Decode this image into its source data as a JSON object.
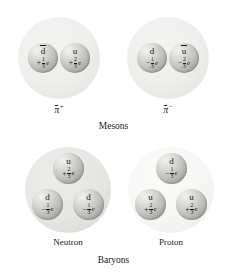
{
  "figure": {
    "sections": [
      {
        "caption": "Mesons",
        "particles": [
          {
            "name": "pi-plus",
            "symbol": "π",
            "superscript": "+",
            "label": "",
            "quarks": [
              {
                "flavor": "d",
                "antiquark": true,
                "charge_sign": "+",
                "numerator": "1",
                "denominator": "3",
                "unit": "e"
              },
              {
                "flavor": "u",
                "antiquark": false,
                "charge_sign": "+",
                "numerator": "2",
                "denominator": "3",
                "unit": "e"
              }
            ]
          },
          {
            "name": "pi-minus",
            "symbol": "π",
            "superscript": "−",
            "label": "",
            "quarks": [
              {
                "flavor": "d",
                "antiquark": false,
                "charge_sign": "−",
                "numerator": "1",
                "denominator": "3",
                "unit": "e"
              },
              {
                "flavor": "u",
                "antiquark": true,
                "charge_sign": "−",
                "numerator": "2",
                "denominator": "3",
                "unit": "e"
              }
            ]
          }
        ]
      },
      {
        "caption": "Baryons",
        "particles": [
          {
            "name": "neutron",
            "symbol": "",
            "superscript": "",
            "label": "Neutron",
            "quarks": [
              {
                "flavor": "u",
                "antiquark": false,
                "charge_sign": "+",
                "numerator": "2",
                "denominator": "3",
                "unit": "e"
              },
              {
                "flavor": "d",
                "antiquark": false,
                "charge_sign": "−",
                "numerator": "1",
                "denominator": "3",
                "unit": "e"
              },
              {
                "flavor": "d",
                "antiquark": false,
                "charge_sign": "−",
                "numerator": "1",
                "denominator": "3",
                "unit": "e"
              }
            ]
          },
          {
            "name": "proton",
            "symbol": "",
            "superscript": "",
            "label": "Proton",
            "quarks": [
              {
                "flavor": "d",
                "antiquark": false,
                "charge_sign": "−",
                "numerator": "1",
                "denominator": "3",
                "unit": "e"
              },
              {
                "flavor": "u",
                "antiquark": false,
                "charge_sign": "+",
                "numerator": "2",
                "denominator": "3",
                "unit": "e"
              },
              {
                "flavor": "u",
                "antiquark": false,
                "charge_sign": "+",
                "numerator": "2",
                "denominator": "3",
                "unit": "e"
              }
            ]
          }
        ]
      }
    ]
  },
  "colors": {
    "background": "#ffffff",
    "text": "#1a1a1a",
    "envelope_light": "#f5f5f4",
    "envelope_gray": "#e6e6e3",
    "quark_light": "#f2f2f0",
    "quark_dark": "#908f8a"
  }
}
